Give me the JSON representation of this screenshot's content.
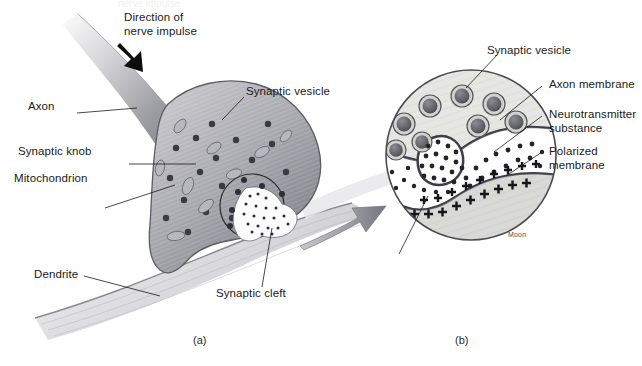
{
  "figure": {
    "background": "#ffffff",
    "width": 642,
    "height": 366,
    "ink": "#1a1a1a",
    "membrane_color": "#4a4a52",
    "cytoplasm_color": "#a8a8ae",
    "cleft_color": "#ffffff",
    "dendrite_color": "#d8d8da"
  },
  "panel_a": {
    "caption": "(a)",
    "cropped_header": "nerve impulse",
    "labels": [
      {
        "id": "direction",
        "text": "Direction of\nnerve impulse"
      },
      {
        "id": "axon",
        "text": "Axon"
      },
      {
        "id": "synaptic-knob",
        "text": "Synaptic knob"
      },
      {
        "id": "mitochondrion",
        "text": "Mitochondrion"
      },
      {
        "id": "dendrite",
        "text": "Dendrite"
      },
      {
        "id": "synaptic-vesicle",
        "text": "Synaptic vesicle"
      },
      {
        "id": "synaptic-cleft",
        "text": "Synaptic cleft"
      }
    ]
  },
  "panel_b": {
    "caption": "(b)",
    "signature": "Moon",
    "labels": [
      {
        "id": "synaptic-vesicle",
        "text": "Synaptic vesicle"
      },
      {
        "id": "axon-membrane",
        "text": "Axon membrane"
      },
      {
        "id": "neurotransmitter",
        "text": "Neurotransmitter\nsubstance"
      },
      {
        "id": "polarized-membrane",
        "text": "Polarized\nmembrane"
      }
    ],
    "charge_symbol": "+"
  }
}
